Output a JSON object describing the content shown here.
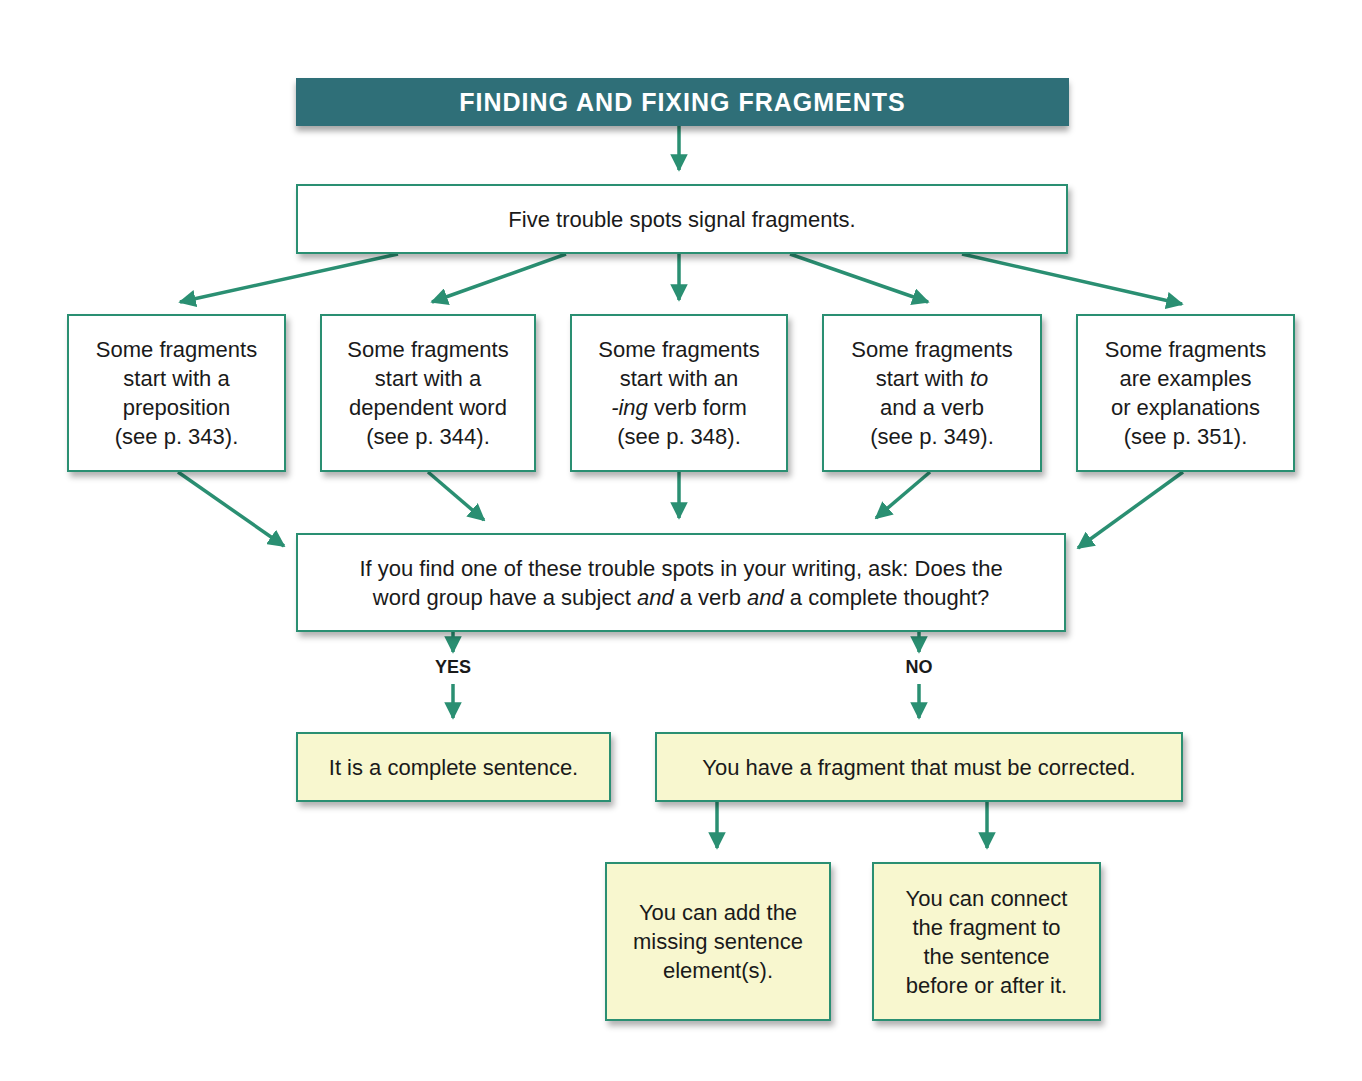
{
  "title": "FINDING AND FIXING FRAGMENTS",
  "colors": {
    "title_bg": "#2f6f78",
    "arrow": "#2a8f72",
    "box_border": "#2a8f72",
    "result_box_bg": "#f8f7cf"
  },
  "intro": "Five trouble spots signal fragments.",
  "trouble_spots": [
    {
      "line1": "Some fragments",
      "line2": "start with a",
      "line3": "preposition",
      "line4": "(see p. 343)."
    },
    {
      "line1": "Some fragments",
      "line2": "start with a",
      "line3": "dependent word",
      "line4": "(see p. 344)."
    },
    {
      "line1": "Some fragments",
      "line2": "start with an",
      "line3_italic": "-ing",
      "line3": " verb form",
      "line4": "(see p. 348)."
    },
    {
      "line1": "Some fragments",
      "line2": "start with ",
      "line2_italic": "to",
      "line3": "and a verb",
      "line4": "(see p. 349)."
    },
    {
      "line1": "Some fragments",
      "line2": "are examples",
      "line3": "or explanations",
      "line4": "(see p. 351)."
    }
  ],
  "question": {
    "line1": "If you find one of these trouble spots in your writing, ask: Does the",
    "line2_a": "word group have a subject ",
    "line2_and1": "and",
    "line2_b": " a verb ",
    "line2_and2": "and",
    "line2_c": " a complete thought?"
  },
  "branches": {
    "yes": "YES",
    "no": "NO"
  },
  "yes_result": "It is a complete sentence.",
  "no_result": "You have a fragment that must be corrected.",
  "fixes": [
    {
      "line1": "You can add the",
      "line2": "missing sentence",
      "line3": "element(s)."
    },
    {
      "line1": "You can connect",
      "line2": "the fragment to",
      "line3": "the sentence",
      "line4": "before or after it."
    }
  ]
}
